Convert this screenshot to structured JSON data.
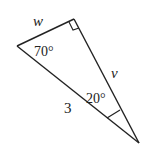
{
  "diagram": {
    "type": "right-triangle",
    "vertices": {
      "right_angle": {
        "x": 74,
        "y": 19
      },
      "left": {
        "x": 17,
        "y": 46
      },
      "bottom": {
        "x": 139,
        "y": 143
      }
    },
    "labels": {
      "side_w": "w",
      "side_v": "v",
      "hypotenuse": "3",
      "angle_left": "70°",
      "angle_bottom": "20°"
    },
    "stroke_color": "#222222",
    "background": "#ffffff"
  }
}
